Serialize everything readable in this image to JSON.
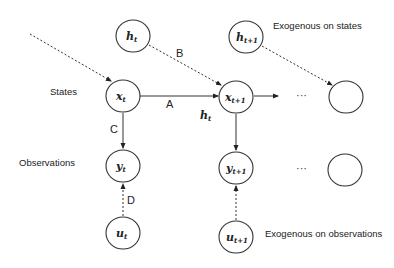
{
  "diagram": {
    "type": "state-space model graph",
    "row_labels": {
      "states": "States",
      "observations": "Observations"
    },
    "annotations": {
      "exogenous_states": "Exogenous on states",
      "exogenous_observations": "Exogenous on observations"
    },
    "nodes": {
      "h_t": {
        "base": "h",
        "sub": "t"
      },
      "h_t1": {
        "base": "h",
        "sub": "t+1"
      },
      "x_t": {
        "base": "x",
        "sub": "t"
      },
      "x_t1": {
        "base": "x",
        "sub": "t+1"
      },
      "y_t": {
        "base": "y",
        "sub": "t"
      },
      "y_t1": {
        "base": "y",
        "sub": "t+1"
      },
      "u_t": {
        "base": "u",
        "sub": "t"
      },
      "u_t1": {
        "base": "u",
        "sub": "t+1"
      },
      "x_next": {
        "base": "",
        "sub": ""
      },
      "y_next": {
        "base": "",
        "sub": ""
      }
    },
    "edge_labels": {
      "A": "A",
      "B": "B",
      "C": "C",
      "D": "D",
      "h_t_below": {
        "base": "h",
        "sub": "t"
      }
    },
    "ellipsis": {
      "states": "···",
      "observations": "···"
    },
    "edges": [
      {
        "from": "incoming",
        "to": "x_t",
        "style": "dashed"
      },
      {
        "from": "h_t",
        "to": "x_t1",
        "label": "B",
        "style": "dashed"
      },
      {
        "from": "x_t",
        "to": "x_t1",
        "label": "A",
        "style": "solid"
      },
      {
        "from": "x_t1",
        "to": "ellipsis",
        "style": "solid"
      },
      {
        "from": "h_t1",
        "to": "x_next",
        "style": "dashed"
      },
      {
        "from": "x_t",
        "to": "y_t",
        "label": "C",
        "style": "solid"
      },
      {
        "from": "x_t1",
        "to": "y_t1",
        "style": "solid"
      },
      {
        "from": "u_t",
        "to": "y_t",
        "label": "D",
        "style": "dashed"
      },
      {
        "from": "u_t1",
        "to": "y_t1",
        "style": "dashed"
      }
    ]
  }
}
